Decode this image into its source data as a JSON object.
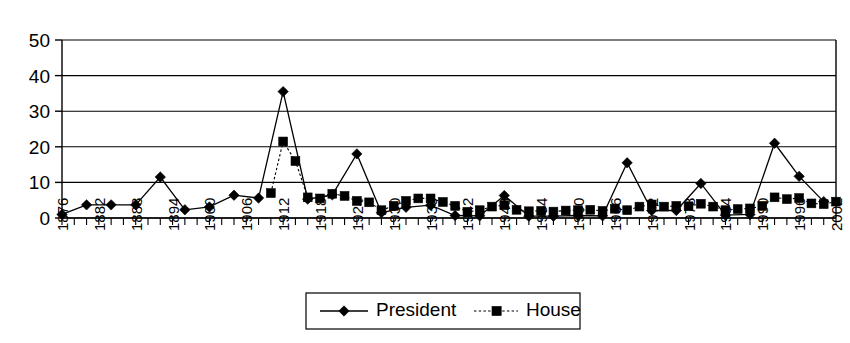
{
  "chart_data": {
    "type": "line",
    "title": "",
    "xlabel": "",
    "ylabel": "",
    "ylim": [
      0,
      50
    ],
    "yticks": [
      0,
      10,
      20,
      30,
      40,
      50
    ],
    "grid": true,
    "legend_position": "bottom",
    "x": [
      1876,
      1878,
      1880,
      1882,
      1884,
      1886,
      1888,
      1890,
      1892,
      1894,
      1896,
      1898,
      1900,
      1902,
      1904,
      1906,
      1908,
      1910,
      1912,
      1914,
      1916,
      1918,
      1920,
      1922,
      1924,
      1926,
      1928,
      1930,
      1932,
      1934,
      1936,
      1938,
      1940,
      1942,
      1944,
      1946,
      1948,
      1950,
      1952,
      1954,
      1956,
      1958,
      1960,
      1962,
      1964,
      1966,
      1968,
      1970,
      1972,
      1974,
      1976,
      1978,
      1980,
      1982,
      1984,
      1986,
      1988,
      1990,
      1992,
      1994,
      1996,
      1998,
      2000,
      2002
    ],
    "xtick_labels": [
      "1876",
      "1882",
      "1888",
      "1894",
      "1900",
      "1906",
      "1912",
      "1918",
      "1924",
      "1930",
      "1936",
      "1942",
      "1948",
      "1954",
      "1960",
      "1966",
      "1972",
      "1978",
      "1984",
      "1990",
      "1996",
      "2002"
    ],
    "xtick_label_interval": 3,
    "series": [
      {
        "name": "President",
        "marker": "diamond",
        "linestyle": "solid",
        "color": "#000000",
        "x": [
          1876,
          1880,
          1884,
          1888,
          1892,
          1896,
          1900,
          1904,
          1908,
          1912,
          1916,
          1920,
          1924,
          1928,
          1932,
          1936,
          1940,
          1944,
          1948,
          1952,
          1956,
          1960,
          1964,
          1968,
          1972,
          1976,
          1980,
          1984,
          1988,
          1992,
          1996,
          2000
        ],
        "values": [
          1.0,
          3.7,
          3.7,
          3.7,
          11.5,
          2.3,
          3.1,
          6.4,
          5.6,
          35.5,
          5.3,
          6.5,
          18.0,
          1.5,
          3.0,
          3.6,
          0.7,
          0.6,
          6.3,
          0.5,
          0.5,
          0.7,
          0.6,
          15.5,
          2.1,
          2.1,
          9.7,
          0.8,
          1.0,
          21.0,
          11.7,
          4.6
        ]
      },
      {
        "name": "House",
        "marker": "square",
        "linestyle": "dotted",
        "color": "#000000",
        "x": [
          1910,
          1912,
          1914,
          1916,
          1918,
          1920,
          1922,
          1924,
          1926,
          1928,
          1930,
          1932,
          1934,
          1936,
          1938,
          1940,
          1942,
          1944,
          1946,
          1948,
          1950,
          1952,
          1954,
          1956,
          1958,
          1960,
          1962,
          1964,
          1966,
          1968,
          1970,
          1972,
          1974,
          1976,
          1978,
          1980,
          1982,
          1984,
          1986,
          1988,
          1990,
          1992,
          1994,
          1996,
          1998,
          2000,
          2002
        ],
        "values": [
          7.0,
          21.5,
          16.0,
          5.8,
          5.5,
          6.8,
          6.2,
          4.8,
          4.4,
          2.2,
          3.4,
          4.8,
          5.5,
          5.5,
          4.5,
          3.4,
          1.7,
          2.2,
          3.2,
          3.6,
          2.3,
          1.9,
          2.0,
          1.8,
          2.1,
          2.2,
          2.3,
          2.0,
          2.6,
          2.2,
          3.2,
          3.8,
          3.2,
          3.4,
          3.3,
          4.0,
          3.2,
          2.2,
          2.5,
          2.7,
          3.4,
          5.8,
          5.3,
          5.6,
          4.1,
          3.9,
          4.6
        ]
      }
    ]
  },
  "legend": {
    "entries": [
      {
        "label": "President",
        "marker": "diamond-marker",
        "line": "solid-line"
      },
      {
        "label": "House",
        "marker": "square-marker",
        "line": "dotted-line"
      }
    ]
  },
  "colors": {
    "series": "#000000",
    "grid": "#000000",
    "background": "#ffffff"
  }
}
